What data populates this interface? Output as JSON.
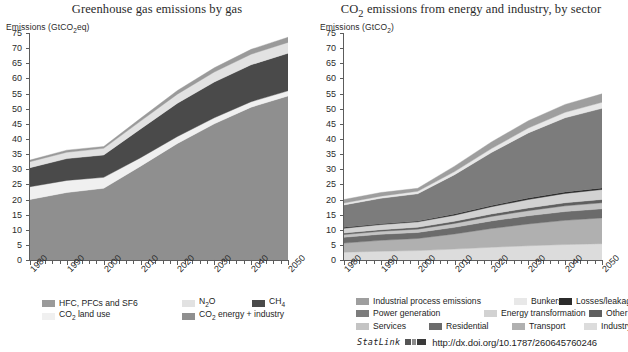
{
  "figure": {
    "statlink_label": "StatLink",
    "statlink_icon": "statlink-glyph-icon",
    "statlink_url": "http://dx.doi.org/10.1787/260645760246"
  },
  "colors": {
    "hfc_pfc_sf6": "#9a9a9a",
    "n2o": "#e2e2e2",
    "ch4": "#4a4a4a",
    "co2_land_use": "#f0f0f0",
    "co2_energy_industry": "#8f8f8f",
    "industrial_process": "#9e9e9e",
    "bunkers": "#e8e8e8",
    "losses_leakages": "#2b2b2b",
    "power_generation": "#7c7c7c",
    "energy_transformation": "#d2d2d2",
    "other": "#5f5f5f",
    "services": "#c4c4c4",
    "residential": "#6b6b6b",
    "transport": "#b0b0b0",
    "industry": "#dcdcdc",
    "axis": "#5c5c5c",
    "text": "#1d1d1d"
  },
  "chart_data": [
    {
      "id": "ghg-by-gas",
      "type": "area",
      "title": "Greenhouse gas emissions by gas",
      "ylabel": "Emissions (GtCO2eq)",
      "ylabel_parts": {
        "pre": "Emissions (GtCO",
        "sub": "2",
        "post": "eq)"
      },
      "xlabel": "",
      "x": [
        1980,
        1990,
        2000,
        2010,
        2020,
        2030,
        2040,
        2050
      ],
      "xlim": [
        1980,
        2050
      ],
      "ylim": [
        0,
        75
      ],
      "yticks": [
        0,
        5,
        10,
        15,
        20,
        25,
        30,
        35,
        40,
        45,
        50,
        55,
        60,
        65,
        70,
        75
      ],
      "xticks": [
        1980,
        1990,
        2000,
        2010,
        2020,
        2030,
        2040,
        2050
      ],
      "grid": false,
      "stacked": true,
      "legend_position": "bottom",
      "series": [
        {
          "name": "CO2 energy + industry",
          "key": "co2_energy_industry",
          "values": [
            20.0,
            22.3,
            23.7,
            31.0,
            38.5,
            45.0,
            50.5,
            54.2
          ]
        },
        {
          "name": "CO2 land use",
          "key": "co2_land_use",
          "values": [
            4.2,
            4.0,
            3.6,
            2.8,
            2.3,
            2.0,
            1.8,
            1.7
          ]
        },
        {
          "name": "CH4",
          "key": "ch4",
          "values": [
            6.3,
            7.2,
            7.4,
            9.5,
            11.0,
            11.8,
            12.2,
            12.4
          ]
        },
        {
          "name": "N2O",
          "key": "n2o",
          "values": [
            2.0,
            2.1,
            2.2,
            2.6,
            3.0,
            3.3,
            3.5,
            3.6
          ]
        },
        {
          "name": "HFC, PFCs and SF6",
          "key": "hfc_pfc_sf6",
          "values": [
            0.5,
            0.7,
            0.6,
            0.9,
            1.2,
            1.4,
            1.6,
            1.7
          ]
        }
      ],
      "legend": [
        {
          "label": "HFC, PFCs and SF6",
          "key": "hfc_pfc_sf6",
          "row": 0,
          "col": 0
        },
        {
          "label": "N2O",
          "key": "n2o",
          "row": 0,
          "col": 1,
          "parts": {
            "pre": "N",
            "sub": "2",
            "post": "O"
          }
        },
        {
          "label": "CH4",
          "key": "ch4",
          "row": 0,
          "col": 2,
          "parts": {
            "pre": "CH",
            "sub": "4",
            "post": ""
          }
        },
        {
          "label": "CO2 land use",
          "key": "co2_land_use",
          "row": 1,
          "col": 0,
          "parts": {
            "pre": "CO",
            "sub": "2",
            "post": " land use"
          }
        },
        {
          "label": "CO2 energy + industry",
          "key": "co2_energy_industry",
          "row": 1,
          "col": 1,
          "parts": {
            "pre": "CO",
            "sub": "2",
            "post": " energy + industry"
          }
        }
      ]
    },
    {
      "id": "co2-by-sector",
      "type": "area",
      "title": "CO2 emissions from energy and industry, by sector",
      "title_parts": {
        "pre": "CO",
        "sub": "2",
        "post": " emissions from energy and industry, by sector"
      },
      "ylabel": "Emissions (GtCO2)",
      "ylabel_parts": {
        "pre": "Emissions (GtCO",
        "sub": "2",
        "post": ")"
      },
      "xlabel": "",
      "x": [
        1980,
        1990,
        2000,
        2010,
        2020,
        2030,
        2040,
        2050
      ],
      "xlim": [
        1980,
        2050
      ],
      "ylim": [
        0,
        75
      ],
      "yticks": [
        0,
        5,
        10,
        15,
        20,
        25,
        30,
        35,
        40,
        45,
        50,
        55,
        60,
        65,
        70,
        75
      ],
      "xticks": [
        1980,
        1990,
        2000,
        2010,
        2020,
        2030,
        2040,
        2050
      ],
      "grid": false,
      "stacked": true,
      "legend_position": "bottom",
      "series": [
        {
          "name": "Industry",
          "key": "industry",
          "values": [
            2.6,
            2.9,
            3.1,
            3.6,
            4.2,
            4.7,
            5.1,
            5.4
          ]
        },
        {
          "name": "Transport",
          "key": "transport",
          "values": [
            3.0,
            3.6,
            4.0,
            5.0,
            6.2,
            7.2,
            8.0,
            8.5
          ]
        },
        {
          "name": "Residential",
          "key": "residential",
          "values": [
            1.9,
            2.0,
            2.0,
            2.2,
            2.5,
            2.7,
            2.9,
            3.0
          ]
        },
        {
          "name": "Services",
          "key": "services",
          "values": [
            0.9,
            1.0,
            1.1,
            1.3,
            1.5,
            1.7,
            1.9,
            2.0
          ]
        },
        {
          "name": "Other",
          "key": "other",
          "values": [
            0.5,
            0.5,
            0.6,
            0.7,
            0.8,
            0.9,
            1.0,
            1.1
          ]
        },
        {
          "name": "Energy transformation",
          "key": "energy_transformation",
          "values": [
            1.6,
            1.7,
            1.8,
            2.0,
            2.4,
            2.8,
            3.1,
            3.3
          ]
        },
        {
          "name": "Losses/leakages",
          "key": "losses_leakages",
          "values": [
            0.3,
            0.3,
            0.3,
            0.4,
            0.4,
            0.5,
            0.5,
            0.5
          ]
        },
        {
          "name": "Power generation",
          "key": "power_generation",
          "values": [
            7.4,
            8.4,
            9.0,
            13.0,
            17.5,
            21.5,
            24.5,
            26.3
          ]
        },
        {
          "name": "Bunkers",
          "key": "bunkers",
          "values": [
            0.6,
            0.7,
            0.8,
            1.0,
            1.3,
            1.6,
            1.8,
            2.0
          ]
        },
        {
          "name": "Industrial process emissions",
          "key": "industrial_process",
          "values": [
            1.2,
            1.2,
            1.0,
            1.8,
            2.2,
            2.4,
            2.6,
            2.8
          ]
        }
      ],
      "legend": [
        {
          "label": "Industrial process emissions",
          "key": "industrial_process",
          "row": 0,
          "col": 0
        },
        {
          "label": "Bunkers",
          "key": "bunkers",
          "row": 0,
          "col": 1
        },
        {
          "label": "Losses/leakages",
          "key": "losses_leakages",
          "row": 0,
          "col": 2
        },
        {
          "label": "Power generation",
          "key": "power_generation",
          "row": 1,
          "col": 0
        },
        {
          "label": "Energy transformation",
          "key": "energy_transformation",
          "row": 1,
          "col": 1
        },
        {
          "label": "Other",
          "key": "other",
          "row": 1,
          "col": 2
        },
        {
          "label": "Services",
          "key": "services",
          "row": 2,
          "col": 0
        },
        {
          "label": "Residential",
          "key": "residential",
          "row": 2,
          "col": 1
        },
        {
          "label": "Transport",
          "key": "transport",
          "row": 2,
          "col": 2
        },
        {
          "label": "Industry",
          "key": "industry",
          "row": 2,
          "col": 3
        }
      ]
    }
  ]
}
